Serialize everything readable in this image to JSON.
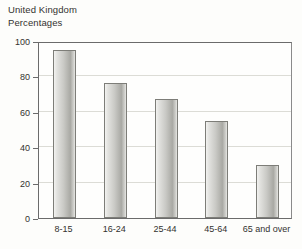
{
  "chart_data": {
    "type": "bar",
    "title": "United Kingdom",
    "subtitle": "Percentages",
    "xlabel": "",
    "ylabel": "",
    "categories": [
      "8-15",
      "16-24",
      "25-44",
      "45-64",
      "65 and over"
    ],
    "values": [
      95,
      76,
      67,
      55,
      30
    ],
    "ylim": [
      0,
      100
    ],
    "ytick_labels": [
      "0",
      "20",
      "40",
      "60",
      "80",
      "100"
    ],
    "ytick_values": [
      0,
      20,
      40,
      60,
      80,
      100
    ],
    "grid": true,
    "legend": null,
    "bar_color": "#c9c9c5",
    "bar_border_color": "#7d7d78",
    "axis_color": "#6b6b6b",
    "grid_color": "#dcdcd6",
    "text_color": "#33322f",
    "background": "#fdfdfb"
  }
}
